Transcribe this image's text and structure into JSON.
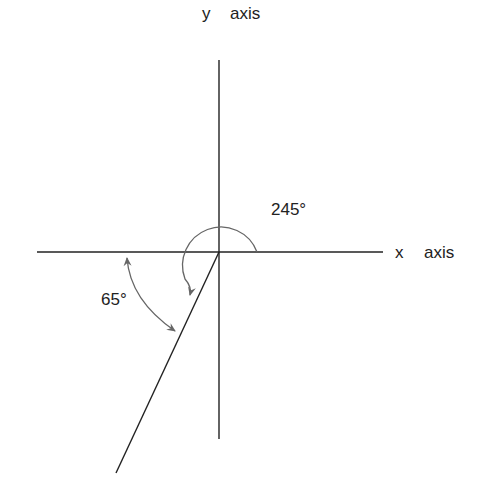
{
  "diagram": {
    "labels": {
      "y_axis_var": "y",
      "y_axis_word": "axis",
      "x_axis_var": "x",
      "x_axis_word": "axis",
      "angle_large": "245°",
      "angle_small": "65°"
    },
    "colors": {
      "line": "#222222",
      "arc": "#666666",
      "text": "#222222"
    }
  }
}
